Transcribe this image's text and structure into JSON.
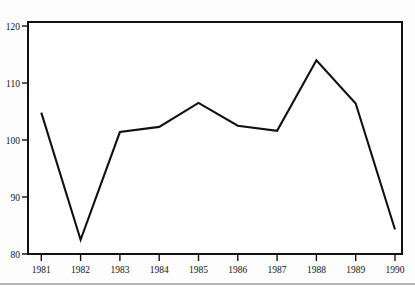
{
  "chart_data": {
    "type": "line",
    "title": "",
    "xlabel": "",
    "ylabel": "",
    "categories": [
      "1981",
      "1982",
      "1983",
      "1984",
      "1985",
      "1986",
      "1987",
      "1988",
      "1989",
      "1990"
    ],
    "x": [
      1981,
      1982,
      1983,
      1984,
      1985,
      1986,
      1987,
      1988,
      1989,
      1990
    ],
    "values": [
      104.8,
      82.5,
      101.4,
      102.3,
      106.5,
      102.5,
      101.6,
      114.0,
      106.4,
      84.3
    ],
    "series": [
      {
        "name": "series-1",
        "values": [
          104.8,
          82.5,
          101.4,
          102.3,
          106.5,
          102.5,
          101.6,
          114.0,
          106.4,
          84.3
        ],
        "color": "#111111"
      }
    ],
    "ylim": [
      80,
      122
    ],
    "xlim": [
      1980.7,
      1990.3
    ],
    "yticks": [
      80,
      90,
      100,
      110,
      120
    ],
    "ytick_labels": [
      "80",
      "90",
      "100",
      "110",
      "120"
    ],
    "xticks": [
      1981,
      1982,
      1983,
      1984,
      1985,
      1986,
      1987,
      1988,
      1989,
      1990
    ],
    "xtick_labels": [
      "1981",
      "1982",
      "1983",
      "1984",
      "1985",
      "1986",
      "1987",
      "1988",
      "1989",
      "1990"
    ],
    "grid": false,
    "legend": false,
    "legend_position": "none",
    "annotations": [],
    "colors": {
      "line": "#111111",
      "frame": "#111111",
      "background": "#ffffff",
      "page_background": "#fdfdfd",
      "text": "#141414",
      "footer_rule": "#6f6f6f"
    }
  }
}
